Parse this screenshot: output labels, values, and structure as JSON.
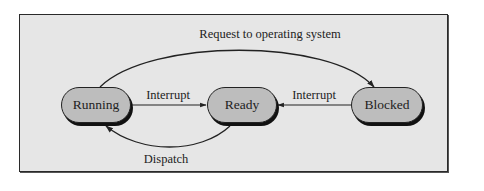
{
  "diagram": {
    "type": "state-transition",
    "colors": {
      "background": "#e6e6e6",
      "node_fill": "#bdbdbd",
      "stroke": "#222222"
    },
    "nodes": [
      {
        "id": "running",
        "label": "Running"
      },
      {
        "id": "ready",
        "label": "Ready"
      },
      {
        "id": "blocked",
        "label": "Blocked"
      }
    ],
    "edges": [
      {
        "from": "running",
        "to": "blocked",
        "label": "Request to operating system"
      },
      {
        "from": "running",
        "to": "ready",
        "label": "Interrupt"
      },
      {
        "from": "blocked",
        "to": "ready",
        "label": "Interrupt"
      },
      {
        "from": "ready",
        "to": "running",
        "label": "Dispatch"
      }
    ]
  }
}
